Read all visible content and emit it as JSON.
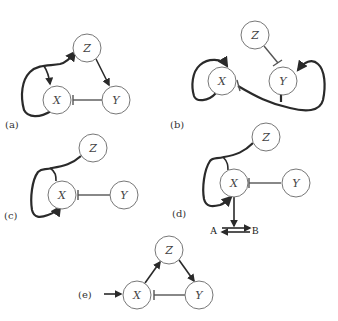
{
  "panels": [
    {
      "id": "a",
      "label": "(a)",
      "nodes": {
        "X": "X",
        "Y": "Y",
        "Z": "Z"
      },
      "edges": [
        {
          "from": "X",
          "to": "Z",
          "type": "activation",
          "note": "curved loop from X bottom to Z, with branch activating X"
        },
        {
          "from": "Z",
          "to": "Y",
          "type": "activation"
        },
        {
          "from": "Y",
          "to": "X",
          "type": "inhibition"
        }
      ]
    },
    {
      "id": "b",
      "label": "(b)",
      "nodes": {
        "X": "X",
        "Y": "Y",
        "Z": "Z"
      },
      "edges": [
        {
          "from": "X",
          "to": "X",
          "type": "activation",
          "note": "self-loop"
        },
        {
          "from": "Z",
          "to": "Y",
          "type": "inhibition"
        },
        {
          "from": "Y",
          "to": "Y",
          "type": "activation",
          "note": "self-loop via bottom"
        },
        {
          "from": "Y",
          "to": "X",
          "type": "inhibition"
        }
      ]
    },
    {
      "id": "c",
      "label": "(c)",
      "nodes": {
        "X": "X",
        "Y": "Y",
        "Z": "Z"
      },
      "edges": [
        {
          "from": "Z",
          "to": "X",
          "type": "activation",
          "note": "curved loop joined with X feedback"
        },
        {
          "from": "Y",
          "to": "X",
          "type": "inhibition"
        }
      ]
    },
    {
      "id": "d",
      "label": "(d)",
      "nodes": {
        "X": "X",
        "Y": "Y",
        "Z": "Z",
        "A": "A",
        "B": "B"
      },
      "edges": [
        {
          "from": "Z",
          "to": "X",
          "type": "activation"
        },
        {
          "from": "Y",
          "to": "X",
          "type": "inhibition"
        },
        {
          "from": "X",
          "to": "A-B",
          "type": "activation"
        },
        {
          "from": "A",
          "to": "B",
          "type": "reversible"
        }
      ]
    },
    {
      "id": "e",
      "label": "(e)",
      "nodes": {
        "X": "X",
        "Y": "Y",
        "Z": "Z"
      },
      "edges": [
        {
          "from": "input",
          "to": "X",
          "type": "activation"
        },
        {
          "from": "X",
          "to": "Z",
          "type": "activation"
        },
        {
          "from": "Z",
          "to": "Y",
          "type": "activation"
        },
        {
          "from": "Y",
          "to": "X",
          "type": "inhibition"
        }
      ]
    }
  ],
  "colors": {
    "stroke": "#2a2a2a",
    "node_border": "#777777",
    "background": "#ffffff"
  }
}
